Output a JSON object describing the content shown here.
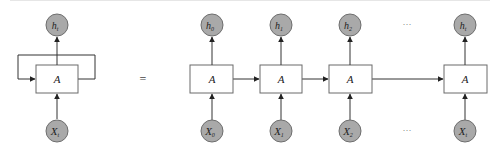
{
  "diagram": {
    "equals_sign": "=",
    "colors": {
      "node_fill": "#a9a9a9",
      "node_stroke": "#6e6e6e",
      "box_stroke": "#6a6a6a",
      "edge": "#333333"
    },
    "rolled": {
      "cell_label": "A",
      "output": {
        "base": "h",
        "sub": "t"
      },
      "input": {
        "base": "X",
        "sub": "t"
      }
    },
    "unrolled": {
      "cells": [
        {
          "label": "A",
          "output": {
            "base": "h",
            "sub": "0"
          },
          "input": {
            "base": "X",
            "sub": "0"
          }
        },
        {
          "label": "A",
          "output": {
            "base": "h",
            "sub": "1"
          },
          "input": {
            "base": "X",
            "sub": "1"
          }
        },
        {
          "label": "A",
          "output": {
            "base": "h",
            "sub": "2"
          },
          "input": {
            "base": "X",
            "sub": "2"
          }
        },
        {
          "label": "A",
          "output": {
            "base": "h",
            "sub": "t"
          },
          "input": {
            "base": "X",
            "sub": "t"
          }
        }
      ],
      "ellipsis_top": "···",
      "ellipsis_bottom": "···"
    }
  }
}
